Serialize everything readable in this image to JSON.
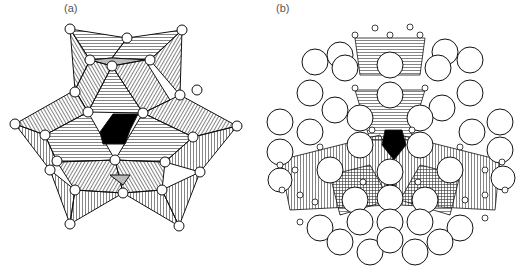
{
  "figure": {
    "panels": [
      {
        "id": "a",
        "label": "(a)",
        "description": "Polyhedral cluster with hatched octahedra and black central tetrahedron"
      },
      {
        "id": "b",
        "label": "(b)",
        "description": "Same polyhedral cluster surrounded by large spheres"
      }
    ],
    "colors": {
      "background": "#ffffff",
      "line": "#111111",
      "center": "#000000",
      "sphere_fill": "#ffffff",
      "label": "#555555"
    }
  }
}
